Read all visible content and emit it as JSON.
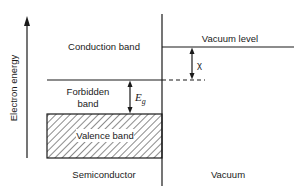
{
  "diagram": {
    "axis_label": "Electron energy",
    "regions": {
      "left": "Semiconductor",
      "right": "Vacuum"
    },
    "bands": {
      "conduction": "Conduction band",
      "forbidden_line1": "Forbidden",
      "forbidden_line2": "band",
      "valence": "Valence band"
    },
    "levels": {
      "vacuum": "Vacuum level"
    },
    "quantities": {
      "band_gap_symbol": "E",
      "band_gap_subscript": "g",
      "electron_affinity_symbol": "χ"
    },
    "colors": {
      "ink": "#1a1a1a",
      "background": "#ffffff"
    }
  }
}
